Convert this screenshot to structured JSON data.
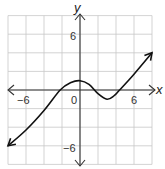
{
  "chart_data": {
    "type": "line",
    "title": "",
    "xlabel": "x",
    "ylabel": "y",
    "xlim": [
      -8,
      8
    ],
    "ylim": [
      -8,
      8
    ],
    "grid": true,
    "grid_step": 2,
    "x_tick_labels": [
      {
        "value": -6,
        "label": "−6"
      },
      {
        "value": 0,
        "label": "0"
      },
      {
        "value": 6,
        "label": "6"
      }
    ],
    "y_tick_labels": [
      {
        "value": 6,
        "label": "6"
      },
      {
        "value": -6,
        "label": "−6"
      }
    ],
    "series": [
      {
        "name": "f(x)",
        "x": [
          -8,
          -6,
          -4,
          -2.2,
          -1,
          0,
          1,
          2,
          3,
          3.8,
          4.4,
          6,
          8
        ],
        "y": [
          -6,
          -4.3,
          -2.2,
          0,
          0.8,
          1,
          0.6,
          -0.4,
          -1,
          -0.6,
          0,
          1.7,
          4
        ],
        "arrows": "both ends"
      }
    ],
    "key_points": {
      "local_max": [
        0,
        1
      ],
      "local_min": [
        3,
        -1
      ],
      "x_intercepts": [
        -2.2,
        4.4
      ]
    },
    "legend": null
  },
  "labels": {
    "x_axis": "x",
    "y_axis": "y",
    "x_neg6": "−6",
    "x_zero": "0",
    "x_pos6": "6",
    "y_pos6": "6",
    "y_neg6": "−6"
  }
}
